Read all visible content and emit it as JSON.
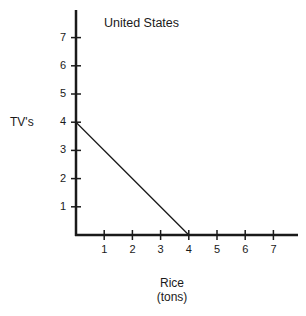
{
  "chart_data": {
    "type": "line",
    "title": "United States",
    "xlabel": "Rice (tons)",
    "xlabel_lines": [
      "Rice",
      "(tons)"
    ],
    "ylabel": "TV's",
    "x_ticks": [
      1,
      2,
      3,
      4,
      5,
      6,
      7
    ],
    "y_ticks": [
      1,
      2,
      3,
      4,
      5,
      6,
      7
    ],
    "xlim": [
      0,
      8
    ],
    "ylim": [
      0,
      8
    ],
    "grid": false,
    "legend": null,
    "series": [
      {
        "name": "Production possibilities frontier",
        "x": [
          0,
          4
        ],
        "y": [
          4,
          0
        ]
      }
    ]
  },
  "labels": {
    "title": "United States",
    "ylabel": "TV's",
    "xlabel_line1": "Rice",
    "xlabel_line2": "(tons)"
  }
}
